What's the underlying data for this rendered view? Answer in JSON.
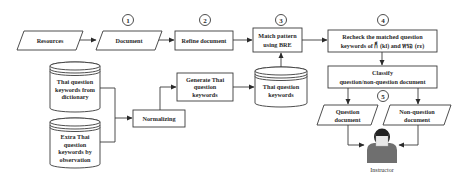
{
  "diagram": {
    "steps": [
      {
        "id": "1",
        "label": "1"
      },
      {
        "id": "2",
        "label": "2"
      },
      {
        "id": "3",
        "label": "3"
      },
      {
        "id": "4",
        "label": "4"
      },
      {
        "id": "5",
        "label": "5"
      }
    ],
    "nodes": {
      "resources": {
        "type": "data",
        "lines": [
          "Resources"
        ]
      },
      "document": {
        "type": "data",
        "lines": [
          "Document"
        ]
      },
      "refine": {
        "type": "process",
        "lines": [
          "Refine document"
        ]
      },
      "match": {
        "type": "process",
        "lines": [
          "Match pattern",
          "using BRE"
        ]
      },
      "recheck": {
        "type": "process",
        "lines": [
          "Recheck the matched question",
          "keywords of ก็ (kl) and หรอ (rɛ)"
        ]
      },
      "classify": {
        "type": "process",
        "lines": [
          "Classify",
          "question/non-question document"
        ]
      },
      "question_doc": {
        "type": "data",
        "lines": [
          "Question",
          "document"
        ]
      },
      "nonquestion_doc": {
        "type": "data",
        "lines": [
          "Non-question",
          "document"
        ]
      },
      "dict_db": {
        "type": "database",
        "lines": [
          "Thai question",
          "keywords from",
          "dictionary"
        ]
      },
      "extra_db": {
        "type": "database",
        "lines": [
          "Extra Thai",
          "question",
          "keywords by",
          "observation"
        ]
      },
      "normalizing": {
        "type": "process",
        "lines": [
          "Normalizing"
        ]
      },
      "generate": {
        "type": "process",
        "lines": [
          "Generate Thai",
          "question",
          "keywords"
        ]
      },
      "keywords_db": {
        "type": "database",
        "lines": [
          "Thai question",
          "keywords"
        ]
      },
      "instructor": {
        "type": "actor",
        "lines": [
          "Instructor"
        ]
      }
    },
    "edges": [
      [
        "resources",
        "document"
      ],
      [
        "document",
        "refine"
      ],
      [
        "refine",
        "match"
      ],
      [
        "match",
        "recheck"
      ],
      [
        "recheck",
        "classify"
      ],
      [
        "classify",
        "question_doc"
      ],
      [
        "classify",
        "nonquestion_doc"
      ],
      [
        "question_doc",
        "instructor"
      ],
      [
        "nonquestion_doc",
        "instructor"
      ],
      [
        "dict_db",
        "normalizing"
      ],
      [
        "extra_db",
        "normalizing"
      ],
      [
        "normalizing",
        "generate"
      ],
      [
        "generate",
        "keywords_db"
      ],
      [
        "keywords_db",
        "match"
      ]
    ]
  }
}
